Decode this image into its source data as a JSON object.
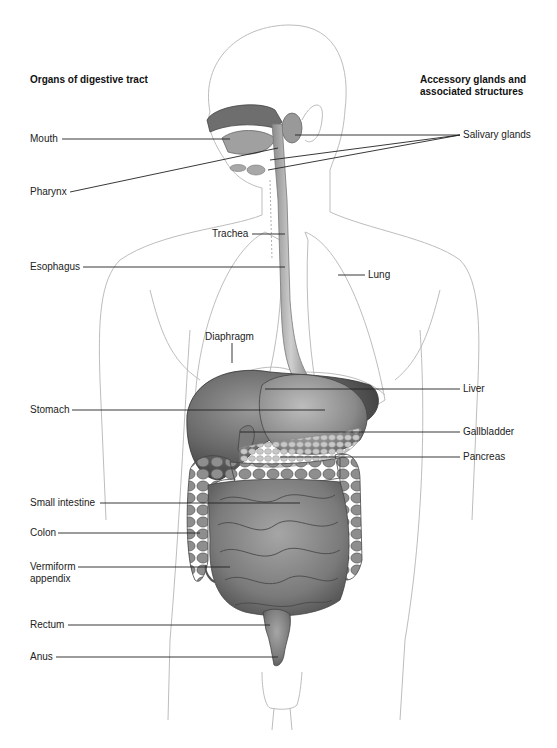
{
  "headers": {
    "left": "Organs of digestive tract",
    "right_line1": "Accessory glands and",
    "right_line2": "associated structures"
  },
  "left_labels": [
    {
      "id": "mouth",
      "text": "Mouth"
    },
    {
      "id": "pharynx",
      "text": "Pharynx"
    },
    {
      "id": "esophagus",
      "text": "Esophagus"
    },
    {
      "id": "stomach",
      "text": "Stomach"
    },
    {
      "id": "small-intestine",
      "text": "Small intestine"
    },
    {
      "id": "colon",
      "text": "Colon"
    },
    {
      "id": "appendix-1",
      "text": "Vermiform"
    },
    {
      "id": "appendix-2",
      "text": "appendix"
    },
    {
      "id": "rectum",
      "text": "Rectum"
    },
    {
      "id": "anus",
      "text": "Anus"
    }
  ],
  "right_labels": [
    {
      "id": "salivary",
      "text": "Salivary glands"
    },
    {
      "id": "lung",
      "text": "Lung"
    },
    {
      "id": "liver",
      "text": "Liver"
    },
    {
      "id": "gallbladder",
      "text": "Gallbladder"
    },
    {
      "id": "pancreas",
      "text": "Pancreas"
    }
  ],
  "center_labels": [
    {
      "id": "trachea",
      "text": "Trachea"
    },
    {
      "id": "diaphragm",
      "text": "Diaphragm"
    }
  ],
  "colors": {
    "outline": "#b8b8b8",
    "organ_dark": "#5a5a5a",
    "organ_mid": "#8c8c8c",
    "organ_light": "#c4c4c4",
    "leader": "#222222"
  }
}
